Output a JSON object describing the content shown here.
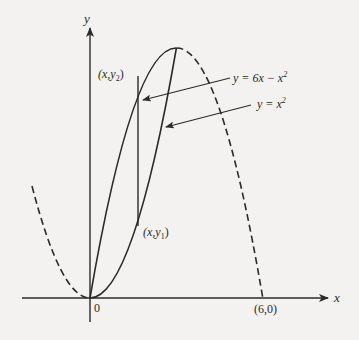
{
  "diagram": {
    "type": "function-graph",
    "axes": {
      "x_label": "x",
      "y_label": "y",
      "origin_label": "0",
      "x_intercept_label": "(6,0)"
    },
    "curves": [
      {
        "id": "upper",
        "equation_label": "y = 6x − x²",
        "eq_main": "y = 6x − x",
        "eq_exp": "2",
        "solid_range": [
          0,
          3
        ],
        "dashed_range": [
          3,
          6
        ]
      },
      {
        "id": "lower",
        "equation_label": "y = x²",
        "eq_main": "y = x",
        "eq_exp": "2",
        "solid_range": [
          0,
          3
        ],
        "dashed_range": [
          -2,
          0
        ]
      }
    ],
    "points": {
      "upper_point": {
        "label_main": "(x,y",
        "label_sub": "2",
        "label_close": ")"
      },
      "lower_point": {
        "label_main": "(x,y",
        "label_sub": "1",
        "label_close": ")"
      }
    },
    "colors": {
      "background": "#f3f2f0",
      "ink": "#2a2a2a"
    }
  }
}
